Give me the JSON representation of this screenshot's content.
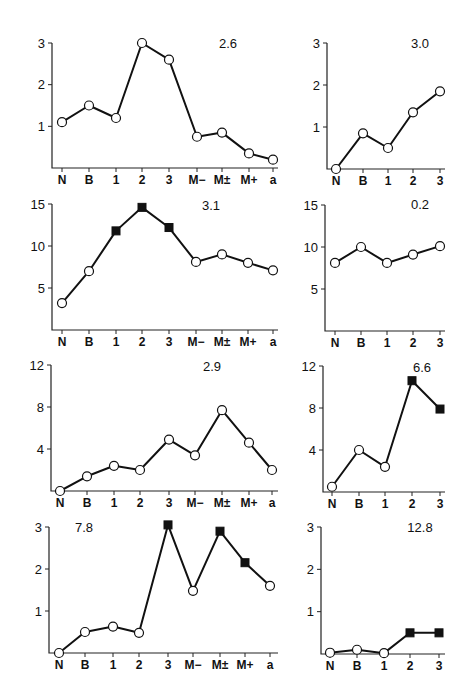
{
  "figure": {
    "panel_count": 8,
    "layout": "4 rows x 2 columns",
    "marker_legend": {
      "open_circle": "open",
      "filled_square": "filled"
    }
  },
  "chart_data": [
    {
      "type": "line",
      "panel": "row1-left",
      "annotation": "2.6",
      "categories": [
        "N",
        "B",
        "1",
        "2",
        "3",
        "M−",
        "M±",
        "M+",
        "a"
      ],
      "values": [
        1.1,
        1.5,
        1.2,
        3.0,
        2.6,
        0.75,
        0.85,
        0.35,
        0.2
      ],
      "markers": [
        "open",
        "open",
        "open",
        "open",
        "open",
        "open",
        "open",
        "open",
        "open"
      ],
      "yticks": [
        1,
        2,
        3
      ],
      "ylim": [
        0,
        3
      ],
      "title": "",
      "xlabel": "",
      "ylabel": ""
    },
    {
      "type": "line",
      "panel": "row1-right",
      "annotation": "3.0",
      "categories": [
        "N",
        "B",
        "1",
        "2",
        "3"
      ],
      "values": [
        0.0,
        0.85,
        0.5,
        1.35,
        1.85
      ],
      "markers": [
        "open",
        "open",
        "open",
        "open",
        "open"
      ],
      "yticks": [
        1,
        2,
        3
      ],
      "ylim": [
        0,
        3
      ],
      "title": "",
      "xlabel": "",
      "ylabel": ""
    },
    {
      "type": "line",
      "panel": "row2-left",
      "annotation": "3.1",
      "categories": [
        "N",
        "B",
        "1",
        "2",
        "3",
        "M−",
        "M±",
        "M+",
        "a"
      ],
      "values": [
        3.2,
        7.0,
        11.8,
        14.6,
        12.2,
        8.1,
        9.0,
        8.0,
        7.1
      ],
      "markers": [
        "open",
        "open",
        "filled",
        "filled",
        "filled",
        "open",
        "open",
        "open",
        "open"
      ],
      "yticks": [
        5,
        10,
        15
      ],
      "ylim": [
        0,
        15
      ],
      "title": "",
      "xlabel": "",
      "ylabel": ""
    },
    {
      "type": "line",
      "panel": "row2-right",
      "annotation": "0.2",
      "categories": [
        "N",
        "B",
        "1",
        "2",
        "3"
      ],
      "values": [
        8.1,
        10.0,
        8.1,
        9.1,
        10.1
      ],
      "markers": [
        "open",
        "open",
        "open",
        "open",
        "open"
      ],
      "yticks": [
        5,
        10,
        15
      ],
      "ylim": [
        0,
        15
      ],
      "title": "",
      "xlabel": "",
      "ylabel": ""
    },
    {
      "type": "line",
      "panel": "row3-left",
      "annotation": "2.9",
      "categories": [
        "N",
        "B",
        "1",
        "2",
        "3",
        "M−",
        "M±",
        "M+",
        "a"
      ],
      "values": [
        0.0,
        1.4,
        2.4,
        2.0,
        4.9,
        3.4,
        7.7,
        4.6,
        2.0
      ],
      "markers": [
        "open",
        "open",
        "open",
        "open",
        "open",
        "open",
        "open",
        "open",
        "open"
      ],
      "yticks": [
        4,
        8,
        12
      ],
      "ylim": [
        0,
        12
      ],
      "title": "",
      "xlabel": "",
      "ylabel": ""
    },
    {
      "type": "line",
      "panel": "row3-right",
      "annotation": "6.6",
      "categories": [
        "N",
        "B",
        "1",
        "2",
        "3"
      ],
      "values": [
        0.5,
        4.0,
        2.4,
        10.6,
        7.9
      ],
      "markers": [
        "open",
        "open",
        "open",
        "filled",
        "filled"
      ],
      "yticks": [
        4,
        8,
        12
      ],
      "ylim": [
        0,
        12
      ],
      "title": "",
      "xlabel": "",
      "ylabel": ""
    },
    {
      "type": "line",
      "panel": "row4-left",
      "annotation": "7.8",
      "categories": [
        "N",
        "B",
        "1",
        "2",
        "3",
        "M−",
        "M±",
        "M+",
        "a"
      ],
      "values": [
        0.0,
        0.5,
        0.63,
        0.48,
        3.05,
        1.48,
        2.9,
        2.15,
        1.6
      ],
      "markers": [
        "open",
        "open",
        "open",
        "open",
        "filled",
        "open",
        "filled",
        "filled",
        "open"
      ],
      "yticks": [
        1,
        2,
        3
      ],
      "ylim": [
        0,
        3
      ],
      "title": "",
      "xlabel": "",
      "ylabel": ""
    },
    {
      "type": "line",
      "panel": "row4-right",
      "annotation": "12.8",
      "categories": [
        "N",
        "B",
        "1",
        "2",
        "3"
      ],
      "values": [
        0.03,
        0.1,
        0.02,
        0.5,
        0.5
      ],
      "markers": [
        "open",
        "open",
        "open",
        "filled",
        "filled"
      ],
      "yticks": [
        1,
        2,
        3
      ],
      "ylim": [
        0,
        3
      ],
      "title": "",
      "xlabel": "",
      "ylabel": ""
    }
  ]
}
